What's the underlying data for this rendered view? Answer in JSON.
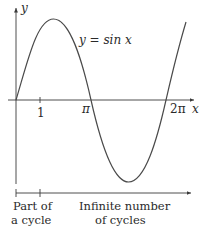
{
  "figure": {
    "axis_labels": {
      "x": "x",
      "y": "y"
    },
    "curve_label": "y = sin x",
    "x_ticks": {
      "one": "1",
      "pi": "π",
      "two_pi": "2π"
    },
    "bottom_labels": {
      "part_line1": "Part of",
      "part_line2": "a cycle",
      "infinite_line1": "Infinite number",
      "infinite_line2": "of cycles"
    },
    "colors": {
      "axis": "#3a3a3a",
      "curve": "#4a4a4a",
      "text": "#2a2a2a"
    }
  }
}
